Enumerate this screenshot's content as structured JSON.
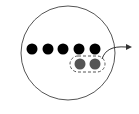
{
  "diagram": {
    "circle": {
      "cx": 68,
      "cy": 53,
      "r": 47,
      "stroke": "#555555",
      "fill": "#ffffff"
    },
    "black_dots": {
      "color": "#000000",
      "r": 5.5,
      "y": 49,
      "x": [
        32,
        48,
        63,
        79,
        95
      ]
    },
    "gray_dots": {
      "color": "#555555",
      "r": 5.5,
      "y": 64,
      "x": [
        80,
        95
      ]
    },
    "dashed_group": {
      "x": 70,
      "y": 56,
      "width": 35,
      "height": 16,
      "rx": 8,
      "stroke": "#555555"
    },
    "arrow": {
      "path": "M102,59 C105,50 112,46 126,47",
      "head": "126,44 132,47 126,50",
      "color": "#333333"
    }
  }
}
